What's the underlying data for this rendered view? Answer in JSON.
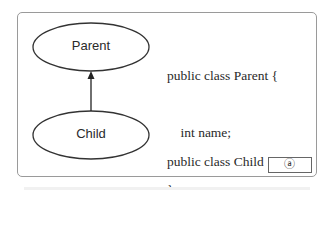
{
  "diagram": {
    "nodes": [
      {
        "id": "parent",
        "label": "Parent"
      },
      {
        "id": "child",
        "label": "Child"
      }
    ],
    "edges": [
      {
        "from": "child",
        "to": "parent",
        "type": "inheritance-arrow"
      }
    ]
  },
  "code": {
    "parent_line1": "public class Parent {",
    "parent_line2": "    int name;",
    "parent_line3": "}",
    "child_line1": "public class Child",
    "child_blank_label": "ⓐ",
    "child_line2": "Parent { }"
  }
}
